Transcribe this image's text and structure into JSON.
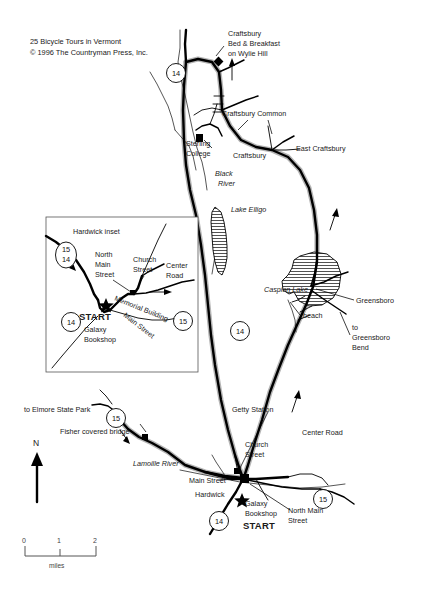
{
  "document": {
    "title": "25 Bicycle Tours in Vermont — Hardwick / Craftsbury bicycle tour map",
    "credit_line_1": "25 Bicycle Tours in Vermont",
    "credit_line_2": "© 1996 The Countryman Press, Inc."
  },
  "labels": {
    "craftsbury_bnb": "Craftsbury\nBed & Breakfast\non Wylie Hill",
    "craftsbury_bnb_l1": "Craftsbury",
    "craftsbury_bnb_l2": "Bed & Breakfast",
    "craftsbury_bnb_l3": "on Wylie Hill",
    "craftsbury_common": "Craftsbury Common",
    "sterling_college_l1": "Sterling",
    "sterling_college_l2": "College",
    "craftsbury": "Craftsbury",
    "east_craftsbury": "East Craftsbury",
    "black_river_l1": "Black",
    "black_river_l2": "River",
    "lake_elligo": "Lake Elligo",
    "caspian_lake": "Caspian Lake",
    "beach": "beach",
    "greensboro": "Greensboro",
    "to_greensboro_bend_l1": "to",
    "to_greensboro_bend_l2": "Greensboro",
    "to_greensboro_bend_l3": "Bend",
    "center_road_east_l1": "Center Road",
    "getty_station": "Getty Station",
    "church_street_l1": "Church",
    "church_street_l2": "Street",
    "main_street": "Main Street",
    "hardwick": "Hardwick",
    "galaxy_bookshop_l1": "Galaxy",
    "galaxy_bookshop_l2": "Bookshop",
    "start": "START",
    "north_main_street_l1": "North Main",
    "north_main_street_l2": "Street",
    "lamoille_river": "Lamoille River",
    "fisher_covered_bridge": "Fisher covered bridge",
    "to_elmore_state_park": "to Elmore State Park",
    "compass_north": "N"
  },
  "inset": {
    "title": "Hardwick inset",
    "north_main_street_l1": "North",
    "north_main_street_l2": "Main",
    "north_main_street_l3": "Street",
    "church_street_l1": "Church",
    "church_street_l2": "Street",
    "center_road_l1": "Center",
    "center_road_l2": "Road",
    "memorial_building": "Memorial Building",
    "main_street": "Main Street",
    "start": "START",
    "galaxy_bookshop_l1": "Galaxy",
    "galaxy_bookshop_l2": "Bookshop",
    "shields": {
      "top_left_upper": "15",
      "top_left_lower": "14",
      "bottom_left": "14",
      "right": "15"
    }
  },
  "route_shields": {
    "top_14": "14",
    "mid_14": "14",
    "bottom_14": "14",
    "bottom_right_15": "15",
    "elmore_15": "15"
  },
  "scale": {
    "tick_0": "0",
    "tick_1": "1",
    "tick_2": "2",
    "unit": "miles"
  },
  "colors": {
    "background": "#ffffff",
    "ink": "#000000",
    "route_casing": "#b5b5b5",
    "text": "#1a1a1a"
  }
}
